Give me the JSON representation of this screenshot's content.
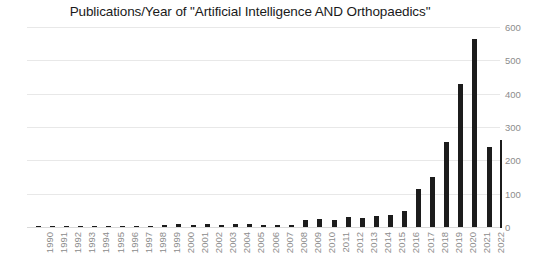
{
  "chart_data": {
    "type": "bar",
    "title": "Publications/Year of \"Artificial Intelligence AND Orthopaedics\"",
    "xlabel": "",
    "ylabel": "",
    "ylim": [
      0,
      600
    ],
    "ytick_step": 100,
    "yticks": [
      "600",
      "500",
      "400",
      "300",
      "200",
      "100",
      "0"
    ],
    "ytick_values": [
      600,
      500,
      400,
      300,
      200,
      100,
      0
    ],
    "grid": true,
    "legend": false,
    "legend_position": "none",
    "y_axis_side": "right",
    "x_tick_rotation": -90,
    "bar_color": "#1c1c1c",
    "grid_color": "#e8e8e8",
    "categories": [
      "1990",
      "1991",
      "1992",
      "1993",
      "1994",
      "1995",
      "1996",
      "1997",
      "1998",
      "1999",
      "2000",
      "2001",
      "2002",
      "2003",
      "2004",
      "2005",
      "2006",
      "2007",
      "2008",
      "2009",
      "2010",
      "2011",
      "2012",
      "2013",
      "2014",
      "2015",
      "2016",
      "2017",
      "2018",
      "2019",
      "2020",
      "2021",
      "2022"
    ],
    "values": [
      2,
      2,
      2,
      1,
      2,
      2,
      2,
      1,
      3,
      6,
      9,
      6,
      9,
      6,
      10,
      9,
      6,
      5,
      7,
      20,
      24,
      21,
      30,
      28,
      33,
      36,
      48,
      113,
      150,
      256,
      430,
      565,
      240
    ]
  }
}
